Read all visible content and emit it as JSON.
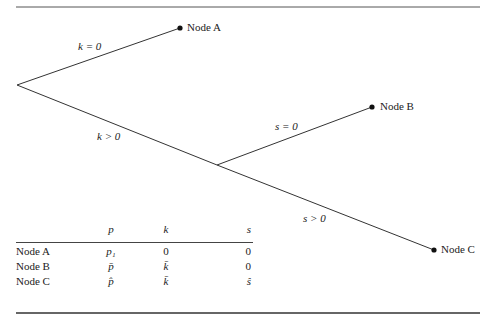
{
  "diagram": {
    "nodes": [
      {
        "id": "A",
        "label": "Node A"
      },
      {
        "id": "B",
        "label": "Node B"
      },
      {
        "id": "C",
        "label": "Node C"
      }
    ],
    "edges": [
      {
        "from": "root",
        "to": "A",
        "label": "k = 0"
      },
      {
        "from": "root",
        "to": "split",
        "label": "k > 0"
      },
      {
        "from": "split",
        "to": "B",
        "label": "s = 0"
      },
      {
        "from": "split",
        "to": "C",
        "label": "s > 0"
      }
    ]
  },
  "table": {
    "headers": [
      "",
      "p",
      "k",
      "s"
    ],
    "rows": [
      {
        "node": "Node A",
        "p": "p₁",
        "k": "0",
        "s": "0"
      },
      {
        "node": "Node B",
        "p": "p̄",
        "k": "k̄",
        "s": "0"
      },
      {
        "node": "Node C",
        "p": "p̂",
        "k": "k̄",
        "s": "ŝ"
      }
    ]
  }
}
